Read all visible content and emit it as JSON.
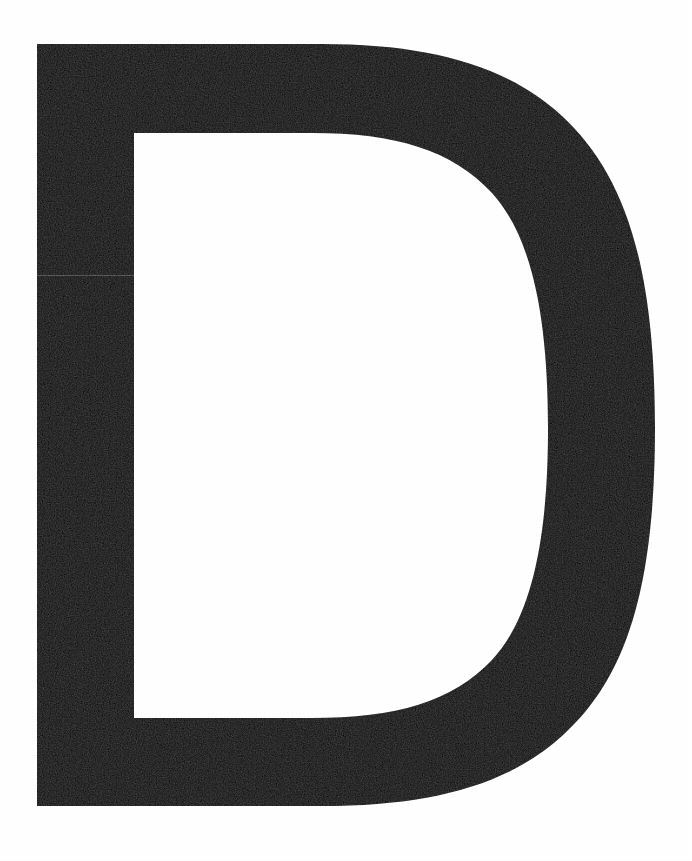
{
  "document": {
    "kind": "type-specimen-sheet",
    "orientation": "portrait",
    "canvas": {
      "width": 692,
      "height": 861
    },
    "background_color": "#ffffff"
  },
  "glyph": {
    "character": "D",
    "name": "latin-capital-letter-d",
    "case": "uppercase",
    "script": "Latin",
    "style": "sans-serif grotesque, heavy weight",
    "fill_color": "#0d0d0d",
    "ink_coverage_note": "solid black with light scan grain",
    "bounds": {
      "left": 37,
      "top": 44,
      "right": 655,
      "bottom": 806,
      "width": 618,
      "height": 762
    },
    "metrics": {
      "stem_left_edge": 37,
      "stem_right_edge": 134,
      "stem_width": 97,
      "bowl_max_stroke": 107,
      "counter_left": 134,
      "counter_top": 133,
      "counter_right": 548,
      "counter_bottom": 718,
      "counter_width": 414,
      "counter_height": 585
    }
  },
  "artifacts": {
    "scan_seam": {
      "label": "horizontal scan seam",
      "x": 37,
      "y": 275,
      "width": 97,
      "height": 1
    }
  },
  "palette": {
    "ink": "#0d0d0d",
    "paper": "#ffffff"
  }
}
